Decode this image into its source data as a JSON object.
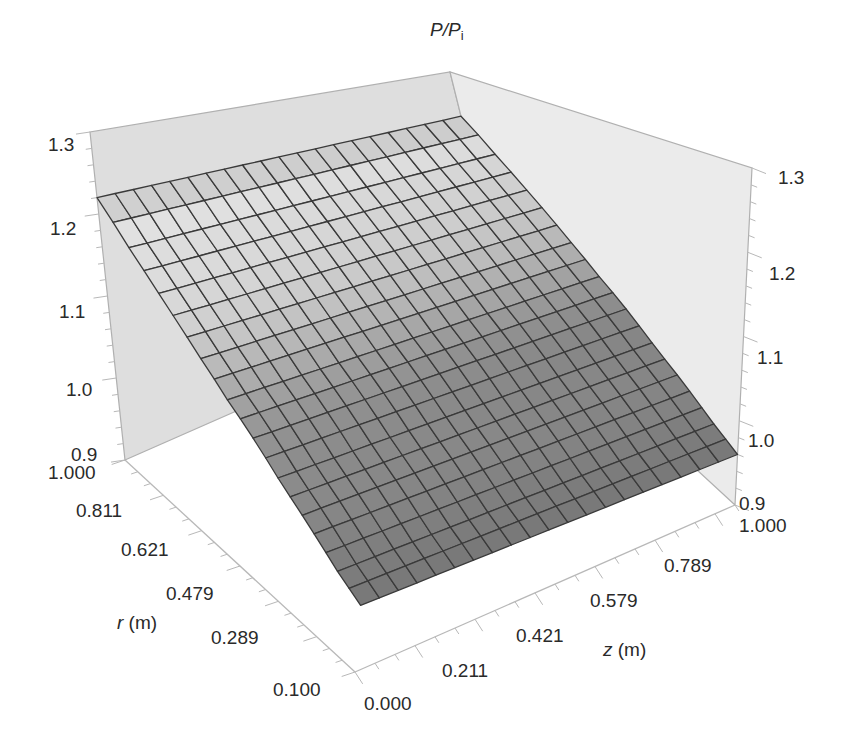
{
  "chart_data": {
    "type": "surface",
    "title": "",
    "zlabel": "P/P_i",
    "xlabel": "z (m)",
    "ylabel": "r (m)",
    "x_axis": {
      "name": "z",
      "unit": "m",
      "range": [
        0.0,
        1.0
      ],
      "tick_labels": [
        "0.000",
        "0.211",
        "0.421",
        "0.579",
        "0.789",
        "1.000"
      ],
      "tick_values": [
        0.0,
        0.211,
        0.421,
        0.579,
        0.789,
        1.0
      ]
    },
    "y_axis": {
      "name": "r",
      "unit": "m",
      "range": [
        0.1,
        1.0
      ],
      "tick_labels": [
        "0.100",
        "0.289",
        "0.479",
        "0.621",
        "0.811",
        "1.000"
      ],
      "tick_values": [
        0.1,
        0.289,
        0.479,
        0.621,
        0.811,
        1.0
      ]
    },
    "z_axis": {
      "name": "P/P_i",
      "range": [
        0.9,
        1.3
      ],
      "tick_labels": [
        "0.9",
        "1.0",
        "1.1",
        "1.2",
        "1.3"
      ],
      "tick_values": [
        0.9,
        1.0,
        1.1,
        1.2,
        1.3
      ]
    },
    "grid_cells": {
      "z": 20,
      "r": 20
    },
    "surface_profile": {
      "description": "P/P_i depends mainly on r: about 1.22 at r = 1.000 decreasing nonlinearly to about 0.96 at r = 0.100; nearly constant along z",
      "r": [
        1.0,
        0.9,
        0.8,
        0.7,
        0.6,
        0.5,
        0.4,
        0.3,
        0.2,
        0.1
      ],
      "P_over_Pi": [
        1.22,
        1.17,
        1.13,
        1.095,
        1.065,
        1.04,
        1.015,
        0.995,
        0.975,
        0.96
      ]
    },
    "box": {
      "walls": [
        "r = 1.000 (left)",
        "z = 1.000 (right)"
      ],
      "wall_color": "#e4e4e4"
    },
    "colormap": "grayscale shading (light at top, dark at low values)"
  },
  "labels": {
    "zaxis_title_main": "P/P",
    "zaxis_title_sub": "i",
    "xaxis_title_var": "z",
    "xaxis_title_unit": " (m)",
    "yaxis_title_var": "r",
    "yaxis_title_unit": " (m)",
    "left_z_ticks": [
      "1.3",
      "1.2",
      "1.1",
      "1.0",
      "0.9"
    ],
    "right_z_ticks": [
      "1.3",
      "1.2",
      "1.1",
      "1.0",
      "0.9"
    ],
    "r_ticks": [
      "1.000",
      "0.811",
      "0.621",
      "0.479",
      "0.289",
      "0.100"
    ],
    "z_ticks": [
      "0.000",
      "0.211",
      "0.421",
      "0.579",
      "0.789",
      "1.000"
    ]
  }
}
